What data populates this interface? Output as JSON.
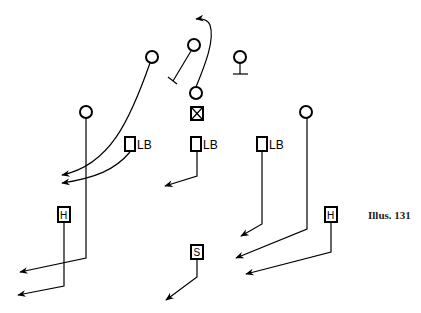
{
  "caption": "Illus. 131",
  "defense": {
    "linebackers": [
      {
        "id": "lb-left",
        "label": "LB",
        "x": 130,
        "y": 144
      },
      {
        "id": "lb-middle",
        "label": "LB",
        "x": 196,
        "y": 144
      },
      {
        "id": "lb-right",
        "label": "LB",
        "x": 262,
        "y": 144
      }
    ],
    "halfbacks": [
      {
        "id": "h-left",
        "label": "H",
        "x": 64,
        "y": 214
      },
      {
        "id": "h-right",
        "label": "H",
        "x": 330,
        "y": 214
      }
    ],
    "safety": {
      "id": "s",
      "label": "S",
      "x": 197,
      "y": 252
    }
  },
  "offense": {
    "center_x_marker": {
      "x": 197,
      "y": 114
    },
    "players": [
      {
        "id": "qb",
        "x": 196,
        "y": 93
      },
      {
        "id": "left-end",
        "x": 152,
        "y": 57
      },
      {
        "id": "left-wing",
        "x": 86,
        "y": 112
      },
      {
        "id": "guard-blocker",
        "x": 194,
        "y": 45
      },
      {
        "id": "right-tackle",
        "x": 240,
        "y": 57
      },
      {
        "id": "right-wing",
        "x": 306,
        "y": 112
      }
    ]
  },
  "legend": {
    "lb_text": "LB",
    "h_text": "H",
    "s_text": "S"
  }
}
